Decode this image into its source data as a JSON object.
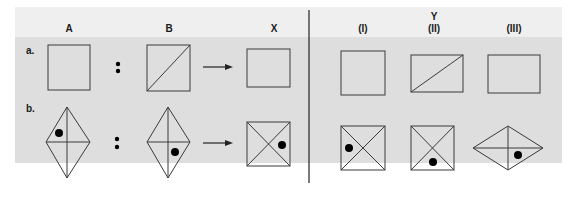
{
  "figure": {
    "colors": {
      "header_band": "#efefef",
      "body_band": "#dedede",
      "stroke": "#3a3a3a",
      "divider": "#222222"
    },
    "headers": {
      "A": "A",
      "B": "B",
      "X": "X",
      "Y": "Y",
      "Y_I": "(I)",
      "Y_II": "(II)",
      "Y_III": "(III)"
    },
    "rows": [
      {
        "label": "a.",
        "A": "square",
        "B": "square with diagonal (bottom-left to top-right)",
        "X": "rectangle",
        "Y": [
          "square",
          "rectangle with diagonal",
          "rectangle"
        ]
      },
      {
        "label": "b.",
        "A": "vertical kite with cross, dot upper-left",
        "B": "vertical kite with cross, dot lower-right",
        "X": "square with X, dot right",
        "Y": [
          "square with X, dot left",
          "square with X, dot bottom",
          "horizontal rhombus with cross, dot lower-right"
        ]
      }
    ],
    "separator": ":",
    "arrow": "right-arrow"
  }
}
